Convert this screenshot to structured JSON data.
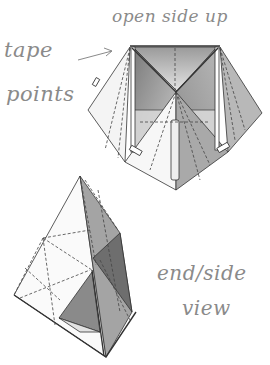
{
  "labels": {
    "open_side_up": "open side up",
    "tape": "tape",
    "points": "points",
    "end_side": "end/side",
    "view": "view"
  },
  "figures": [
    {
      "name": "top-view-model",
      "caption": "open side up"
    },
    {
      "name": "end-side-view-model",
      "caption": "end/side view"
    }
  ],
  "annotations": [
    {
      "type": "arrow",
      "from": "tape points",
      "to": "top-left corner of model"
    }
  ],
  "colors": {
    "ink": "#8a8a8a",
    "line": "#333333",
    "shade_light": "#d8d8d8",
    "shade_mid": "#a8a8a8",
    "shade_dark": "#6e6e6e"
  }
}
